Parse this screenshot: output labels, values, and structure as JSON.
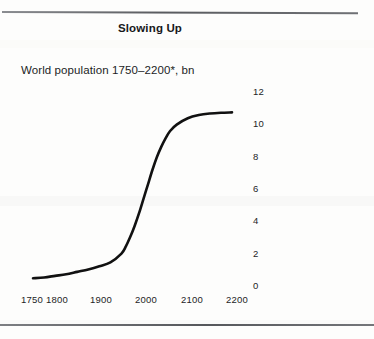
{
  "figure": {
    "title": "Slowing Up",
    "subtitle": "World population 1750–2200*, bn"
  },
  "chart_data": {
    "type": "line",
    "title": "Slowing Up",
    "subtitle": "World population 1750–2200*, bn",
    "xlabel": "",
    "ylabel": "bn",
    "xlim": [
      1750,
      2200
    ],
    "ylim": [
      0,
      12
    ],
    "grid": false,
    "legend": null,
    "xticks": [
      1750,
      1800,
      1900,
      2000,
      2100,
      2200
    ],
    "xticklabels": [
      "1750",
      "1800",
      "1900",
      "2000",
      "2100",
      "2200"
    ],
    "yticks": [
      0,
      2,
      4,
      6,
      8,
      10,
      12
    ],
    "yticklabels": [
      "0",
      "2",
      "4",
      "6",
      "8",
      "10",
      "12"
    ],
    "y_axis_position": "right",
    "series": [
      {
        "name": "World population",
        "color": "#111111",
        "x": [
          1750,
          1775,
          1800,
          1825,
          1850,
          1875,
          1900,
          1925,
          1950,
          1960,
          1970,
          1980,
          1990,
          2000,
          2010,
          2020,
          2030,
          2040,
          2050,
          2060,
          2075,
          2100,
          2125,
          2150,
          2175,
          2200
        ],
        "values": [
          0.3,
          0.35,
          0.45,
          0.55,
          0.7,
          0.85,
          1.05,
          1.3,
          1.85,
          2.3,
          2.9,
          3.6,
          4.4,
          5.3,
          6.2,
          7.1,
          7.9,
          8.55,
          9.1,
          9.55,
          9.95,
          10.35,
          10.55,
          10.65,
          10.7,
          10.72
        ]
      }
    ],
    "footnote_marker": "*"
  },
  "ytick_labels": [
    "12",
    "10",
    "8",
    "6",
    "4",
    "2",
    "0"
  ],
  "xtick_labels": [
    "1750",
    "1800",
    "1900",
    "2000",
    "2100",
    "2200"
  ]
}
